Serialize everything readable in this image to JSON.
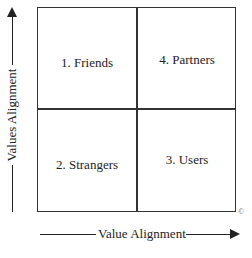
{
  "diagram": {
    "type": "2x2 matrix",
    "quadrants": {
      "top_left": "1. Friends",
      "top_right": "4. Partners",
      "bottom_left": "2. Strangers",
      "bottom_right": "3. Users"
    },
    "x_axis_label": "Value Alignment",
    "y_axis_label": "Values Alignment",
    "copyright": "©"
  }
}
